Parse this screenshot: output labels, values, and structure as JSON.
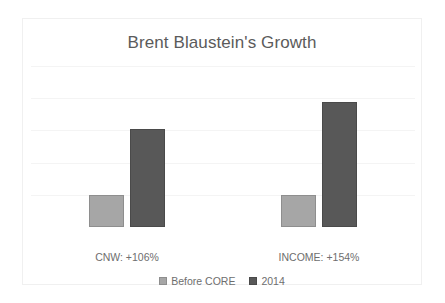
{
  "chart_data": {
    "type": "bar",
    "title": "Brent Blaustein's Growth",
    "xlabel": "",
    "ylabel": "",
    "categories": [
      "CNW: +106%",
      "INCOME: +154%"
    ],
    "series": [
      {
        "name": "Before CORE",
        "color": "#a6a6a6",
        "values": [
          100,
          100
        ]
      },
      {
        "name": "2014",
        "color": "#585858",
        "values": [
          303,
          388
        ]
      }
    ],
    "ylim": [
      0,
      500
    ],
    "grid": true,
    "grid_values": [
      100,
      200,
      300,
      400,
      500
    ],
    "axis_tick_labels_visible": false,
    "legend_position": "bottom",
    "annotations": []
  },
  "legend": {
    "entries": [
      {
        "label": "Before CORE",
        "swatch": "legend-swatch-before-core"
      },
      {
        "label": "2014",
        "swatch": "legend-swatch-2014"
      }
    ]
  },
  "colors": {
    "background": "#ffffff",
    "frame_border": "#f0f0f0",
    "title_text": "#5b5b5b",
    "label_text": "#6e6e6e",
    "gridline": "#f4f4f4",
    "series_before_core": "#a6a6a6",
    "series_2014": "#585858"
  }
}
